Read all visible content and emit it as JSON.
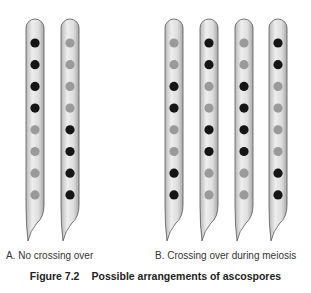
{
  "figure": {
    "number": "Figure 7.2",
    "title": "Possible arrangements of ascospores"
  },
  "panels": [
    {
      "label": "A. No crossing over",
      "asci": [
        [
          "dark",
          "dark",
          "dark",
          "dark",
          "light",
          "light",
          "light",
          "light"
        ],
        [
          "light",
          "light",
          "light",
          "light",
          "dark",
          "dark",
          "dark",
          "dark"
        ]
      ]
    },
    {
      "label": "B. Crossing over during meiosis",
      "asci": [
        [
          "light",
          "light",
          "dark",
          "dark",
          "light",
          "light",
          "dark",
          "dark"
        ],
        [
          "dark",
          "dark",
          "light",
          "light",
          "dark",
          "dark",
          "light",
          "light"
        ],
        [
          "light",
          "light",
          "dark",
          "dark",
          "dark",
          "dark",
          "light",
          "light"
        ],
        [
          "dark",
          "dark",
          "light",
          "light",
          "light",
          "light",
          "dark",
          "dark"
        ]
      ]
    }
  ],
  "colors": {
    "dark": "#151515",
    "light": "#9a9a9a",
    "ascus_fill": "#dcdcdc",
    "ascus_stroke": "#555555"
  }
}
